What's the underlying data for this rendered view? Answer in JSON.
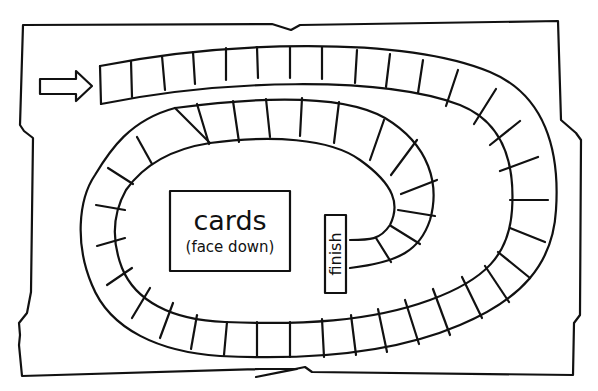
{
  "board": {
    "title": "Board game track",
    "line_color": "#111111",
    "background": "#ffffff"
  },
  "start_arrow": {
    "icon": "arrow-right-icon"
  },
  "cards_box": {
    "line1": "cards",
    "line2": "(face down)"
  },
  "finish_box": {
    "label": "finish"
  }
}
